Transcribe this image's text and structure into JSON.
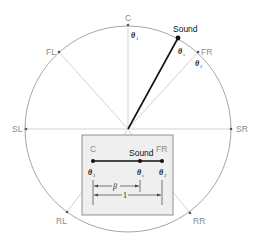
{
  "diagram": {
    "colors": {
      "circle": "#8f8f8f",
      "speaker_line": "#c8c8c8",
      "sound_line": "#111111",
      "inset_fill": "#efefef",
      "inset_border": "#777777",
      "label_gray": "#8a8a8a",
      "label_dark": "#111111"
    },
    "speakers": [
      {
        "id": "C",
        "label": "C"
      },
      {
        "id": "FL",
        "label": "FL"
      },
      {
        "id": "FR",
        "label": "FR"
      },
      {
        "id": "SL",
        "label": "SL"
      },
      {
        "id": "SR",
        "label": "SR"
      },
      {
        "id": "RL",
        "label": "RL"
      },
      {
        "id": "RR",
        "label": "RR"
      }
    ],
    "sound": {
      "label": "Sound"
    },
    "angles": {
      "theta": "θ",
      "theta1_sub": "1",
      "thetas_sub": "s",
      "theta2_sub": "2"
    },
    "inset": {
      "left_label": "C",
      "right_label": "FR",
      "sound_label": "Sound",
      "beta_label": "β",
      "length_label": "1"
    }
  }
}
